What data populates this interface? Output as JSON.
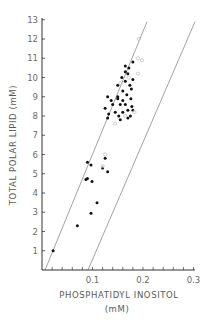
{
  "chart_data": {
    "type": "scatter",
    "title": "",
    "xlabel": "PHOSPHATIDYL INOSITOL",
    "xlabel_unit": "(mM)",
    "ylabel": "TOTAL POLAR LIPID (mM)",
    "xlim": [
      0,
      0.3
    ],
    "ylim": [
      0,
      13
    ],
    "x_ticks": [
      "0.1",
      "0.2",
      "0.3"
    ],
    "y_ticks": [
      "1",
      "2",
      "3",
      "4",
      "5",
      "6",
      "7",
      "8",
      "9",
      "10",
      "11",
      "12",
      "13"
    ],
    "grid": false,
    "legend": null,
    "colors": {
      "axis": "#333333",
      "filled": "#111111",
      "open": "#c8c8c8",
      "line": "#8a8a8a",
      "text": "#6a6a6a"
    },
    "boundary_lines": [
      {
        "name": "upper-bound",
        "x1": 0.006,
        "y1": 0,
        "x2": 0.208,
        "y2": 12.9
      },
      {
        "name": "lower-bound",
        "x1": 0.091,
        "y1": 0,
        "x2": 0.303,
        "y2": 12.9
      }
    ],
    "series": [
      {
        "name": "filled",
        "marker": "filled-circle",
        "points": [
          [
            0.022,
            1.0
          ],
          [
            0.07,
            2.3
          ],
          [
            0.087,
            4.7
          ],
          [
            0.09,
            4.75
          ],
          [
            0.099,
            4.6
          ],
          [
            0.09,
            5.6
          ],
          [
            0.097,
            5.45
          ],
          [
            0.097,
            2.95
          ],
          [
            0.109,
            3.5
          ],
          [
            0.12,
            5.3
          ],
          [
            0.125,
            5.8
          ],
          [
            0.13,
            5.1
          ],
          [
            0.13,
            7.9
          ],
          [
            0.125,
            8.4
          ],
          [
            0.132,
            8.1
          ],
          [
            0.13,
            9.0
          ],
          [
            0.137,
            8.8
          ],
          [
            0.14,
            8.6
          ],
          [
            0.145,
            8.2
          ],
          [
            0.15,
            8.9
          ],
          [
            0.152,
            8.0
          ],
          [
            0.155,
            7.8
          ],
          [
            0.16,
            8.2
          ],
          [
            0.165,
            8.6
          ],
          [
            0.17,
            8.3
          ],
          [
            0.17,
            7.9
          ],
          [
            0.175,
            8.0
          ],
          [
            0.178,
            8.5
          ],
          [
            0.18,
            8.3
          ],
          [
            0.176,
            8.9
          ],
          [
            0.168,
            9.1
          ],
          [
            0.16,
            9.3
          ],
          [
            0.15,
            9.0
          ],
          [
            0.15,
            9.6
          ],
          [
            0.158,
            10.0
          ],
          [
            0.165,
            10.3
          ],
          [
            0.17,
            10.2
          ],
          [
            0.165,
            9.8
          ],
          [
            0.174,
            9.6
          ],
          [
            0.18,
            9.9
          ],
          [
            0.172,
            10.5
          ],
          [
            0.165,
            10.6
          ],
          [
            0.18,
            10.8
          ],
          [
            0.177,
            9.4
          ],
          [
            0.155,
            8.6
          ],
          [
            0.16,
            8.8
          ]
        ]
      },
      {
        "name": "open",
        "marker": "open-circle",
        "points": [
          [
            0.192,
            12.0
          ],
          [
            0.19,
            11.0
          ],
          [
            0.198,
            10.9
          ],
          [
            0.19,
            10.2
          ],
          [
            0.183,
            8.2
          ],
          [
            0.172,
            10.0
          ],
          [
            0.155,
            9.7
          ],
          [
            0.165,
            8.0
          ],
          [
            0.145,
            7.6
          ],
          [
            0.125,
            6.0
          ],
          [
            0.12,
            5.4
          ]
        ]
      }
    ]
  }
}
